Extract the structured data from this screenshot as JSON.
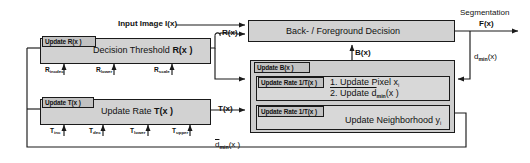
{
  "diagram": {
    "colors": {
      "box_fill": "#d2d2d2",
      "tag_fill": "#c2c2c2",
      "outline": "#1a1a1a",
      "background": "#ffffff"
    }
  },
  "signals": {
    "input_image": "Input Image I(x)",
    "segmentation_line1": "Segmentation",
    "segmentation_line2": "F(x)",
    "r_of_x": "R(x)",
    "t_of_x": "T(x)",
    "b_of_x": "B(x)",
    "d_min_x": "d",
    "d_min_sub": "min",
    "d_min_arg": "(x)",
    "dbar_min_x": "d",
    "dbar_min_sub": "min",
    "dbar_min_arg": "(x )"
  },
  "blocks": {
    "decision": {
      "title": "Back- / Foreground Decision"
    },
    "threshold": {
      "tag": "Update R(x )",
      "title_pre": "Decision Threshold ",
      "title_bold": "R(x )",
      "ticks": [
        {
          "base": "R",
          "sub": "incdec"
        },
        {
          "base": "R",
          "sub": "lower"
        },
        {
          "base": "R",
          "sub": "scale"
        }
      ]
    },
    "update_rate": {
      "tag": "Update T(x )",
      "title_pre": "Update Rate ",
      "title_bold": "T(x )",
      "ticks": [
        {
          "base": "T",
          "sub": "inc"
        },
        {
          "base": "T",
          "sub": "dec"
        },
        {
          "base": "T",
          "sub": "lower"
        },
        {
          "base": "T",
          "sub": "upper"
        }
      ]
    },
    "update_b": {
      "tag": "Update B(x )",
      "sub_blocks": [
        {
          "tag": "Update Rate 1/T(x )",
          "lines": [
            "1. Update Pixel x",
            "2. Update d"
          ],
          "line1_sub": "i",
          "line2_sub": "min",
          "line2_arg": "(x )"
        },
        {
          "tag": "Update Rate 1/T(x )",
          "lines": [
            "Update Neighborhood y"
          ],
          "line1_sub": "i"
        }
      ]
    }
  }
}
